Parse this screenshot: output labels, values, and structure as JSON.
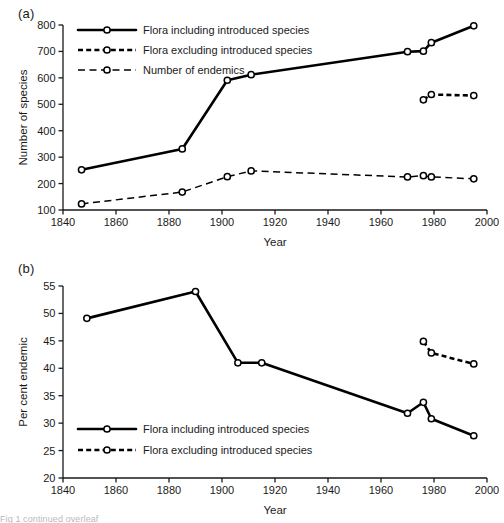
{
  "figure": {
    "panel_a_label": "(a)",
    "panel_b_label": "(b)",
    "trailing_caption": "Fig 1 continued overleaf"
  },
  "chart_data": [
    {
      "id": "panel-a",
      "type": "line",
      "title": "(a)",
      "xlabel": "Year",
      "ylabel": "Number of species",
      "xlim": [
        1840,
        2000
      ],
      "ylim": [
        100,
        800
      ],
      "xticks": [
        1840,
        1860,
        1880,
        1900,
        1920,
        1940,
        1960,
        1980,
        2000
      ],
      "yticks": [
        100,
        200,
        300,
        400,
        500,
        600,
        700,
        800
      ],
      "grid": false,
      "legend_position": "top-left",
      "series": [
        {
          "name": "Flora including introduced species",
          "style": "solid",
          "x": [
            1847,
            1885,
            1902,
            1911,
            1970,
            1976,
            1979,
            1995
          ],
          "values": [
            252,
            331,
            591,
            612,
            699,
            701,
            733,
            797
          ]
        },
        {
          "name": "Flora excluding introduced species",
          "style": "dashed-heavy",
          "x": [
            1976,
            1979,
            1995
          ],
          "values": [
            517,
            537,
            533
          ]
        },
        {
          "name": "Number of endemics",
          "style": "dashed-light",
          "x": [
            1847,
            1885,
            1902,
            1911,
            1970,
            1976,
            1979,
            1995
          ],
          "values": [
            123,
            168,
            226,
            248,
            225,
            230,
            225,
            218
          ]
        }
      ]
    },
    {
      "id": "panel-b",
      "type": "line",
      "title": "(b)",
      "xlabel": "Year",
      "ylabel": "Per cent endemic",
      "xlim": [
        1840,
        2000
      ],
      "ylim": [
        20,
        55
      ],
      "xticks": [
        1840,
        1860,
        1880,
        1900,
        1920,
        1940,
        1960,
        1980,
        2000
      ],
      "yticks": [
        20,
        25,
        30,
        35,
        40,
        45,
        50,
        55
      ],
      "grid": false,
      "legend_position": "bottom-left",
      "series": [
        {
          "name": "Flora including introduced species",
          "style": "solid",
          "x": [
            1849,
            1890,
            1906,
            1915,
            1970,
            1976,
            1979,
            1995
          ],
          "values": [
            49.1,
            54.0,
            41.0,
            41.0,
            31.8,
            33.8,
            30.8,
            27.7
          ]
        },
        {
          "name": "Flora excluding introduced species",
          "style": "dashed-heavy",
          "x": [
            1976,
            1979,
            1995
          ],
          "values": [
            44.9,
            42.8,
            40.8
          ]
        }
      ]
    }
  ]
}
